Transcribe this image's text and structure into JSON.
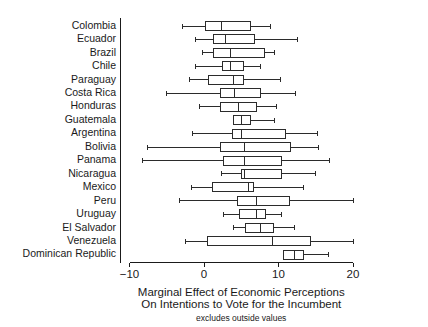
{
  "chart_data": {
    "type": "boxplot",
    "title": "",
    "xlabel": "Marginal Effect of Economic Perceptions\nOn Intentions to Vote for the Incumbent",
    "xlabel_line1": "Marginal Effect of Economic Perceptions",
    "xlabel_line2": "On Intentions to Vote for the Incumbent",
    "ylabel": "",
    "note": "excludes outside values",
    "orientation": "horizontal",
    "grid": false,
    "legend": null,
    "xlim": [
      -12.5,
      21.5
    ],
    "xticks": [
      -10,
      0,
      10,
      20
    ],
    "xtick_labels": [
      "−10",
      "0",
      "10",
      "20"
    ],
    "categories": [
      "Colombia",
      "Ecuador",
      "Brazil",
      "Chile",
      "Paraguay",
      "Costa Rica",
      "Honduras",
      "Guatemala",
      "Argentina",
      "Bolivia",
      "Panama",
      "Nicaragua",
      "Mexico",
      "Peru",
      "Uruguay",
      "El Salvador",
      "Venezuela",
      "Dominican Republic"
    ],
    "boxes": [
      {
        "category": "Colombia",
        "whisker_low": -2.9,
        "q1": 0.2,
        "median": 2.4,
        "q3": 6.2,
        "whisker_high": 8.9
      },
      {
        "category": "Ecuador",
        "whisker_low": -1.1,
        "q1": 1.3,
        "median": 2.9,
        "q3": 6.8,
        "whisker_high": 12.6
      },
      {
        "category": "Brazil",
        "whisker_low": -0.2,
        "q1": 1.3,
        "median": 3.6,
        "q3": 8.1,
        "whisker_high": 9.4
      },
      {
        "category": "Chile",
        "whisker_low": -1.2,
        "q1": 2.5,
        "median": 3.6,
        "q3": 5.3,
        "whisker_high": 7.6
      },
      {
        "category": "Paraguay",
        "whisker_low": -2.0,
        "q1": 0.6,
        "median": 3.9,
        "q3": 5.3,
        "whisker_high": 10.3
      },
      {
        "category": "Costa Rica",
        "whisker_low": -5.0,
        "q1": 2.2,
        "median": 4.1,
        "q3": 7.6,
        "whisker_high": 12.3
      },
      {
        "category": "Honduras",
        "whisker_low": -0.6,
        "q1": 2.2,
        "median": 4.6,
        "q3": 7.0,
        "whisker_high": 9.7
      },
      {
        "category": "Guatemala",
        "whisker_low": 3.9,
        "q1": 3.9,
        "median": 5.0,
        "q3": 6.2,
        "whisker_high": 9.4
      },
      {
        "category": "Argentina",
        "whisker_low": -1.6,
        "q1": 3.8,
        "median": 5.0,
        "q3": 11.0,
        "whisker_high": 15.2
      },
      {
        "category": "Bolivia",
        "whisker_low": -7.6,
        "q1": 2.2,
        "median": 5.4,
        "q3": 11.6,
        "whisker_high": 15.4
      },
      {
        "category": "Panama",
        "whisker_low": -8.3,
        "q1": 2.6,
        "median": 5.5,
        "q3": 10.4,
        "whisker_high": 16.9
      },
      {
        "category": "Nicaragua",
        "whisker_low": 2.3,
        "q1": 5.0,
        "median": 5.5,
        "q3": 10.4,
        "whisker_high": 15.0
      },
      {
        "category": "Mexico",
        "whisker_low": -1.7,
        "q1": 1.1,
        "median": 6.0,
        "q3": 6.6,
        "whisker_high": 13.3
      },
      {
        "category": "Peru",
        "whisker_low": -3.3,
        "q1": 4.5,
        "median": 7.0,
        "q3": 11.5,
        "whisker_high": 20.0
      },
      {
        "category": "Uruguay",
        "whisker_low": 2.6,
        "q1": 4.8,
        "median": 7.0,
        "q3": 8.2,
        "whisker_high": 10.4
      },
      {
        "category": "El Salvador",
        "whisker_low": 4.0,
        "q1": 5.6,
        "median": 7.6,
        "q3": 9.3,
        "whisker_high": 12.2
      },
      {
        "category": "Venezuela",
        "whisker_low": -2.5,
        "q1": 0.5,
        "median": 9.2,
        "q3": 14.3,
        "whisker_high": 20.0
      },
      {
        "category": "Dominican Republic",
        "whisker_low": 10.7,
        "q1": 10.7,
        "median": 12.2,
        "q3": 13.3,
        "whisker_high": 16.7
      }
    ],
    "colors": {
      "box_fill": "#ffffff",
      "box_stroke": "#2b2b2b",
      "axis": "#1a1a1a",
      "text": "#1a1a1a",
      "background": "#ffffff"
    }
  }
}
